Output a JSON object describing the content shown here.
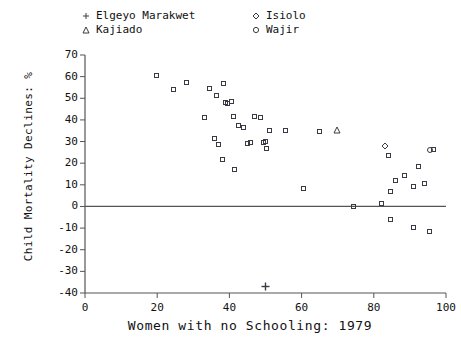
{
  "chart_data": {
    "type": "scatter",
    "title": "",
    "xlabel": "Women with no Schooling: 1979",
    "ylabel": "Child Mortality Declines: %",
    "xlim": [
      0,
      100
    ],
    "ylim": [
      -40,
      70
    ],
    "xticks": [
      0,
      20,
      40,
      60,
      80,
      100
    ],
    "yticks": [
      70,
      60,
      50,
      40,
      30,
      20,
      10,
      0,
      -10,
      -20,
      -30,
      -40
    ],
    "grid": false,
    "zero_reference_line": 0,
    "legend_position": "top",
    "legend": [
      {
        "label": "Elgeyo Marakwet",
        "marker": "plus"
      },
      {
        "label": "Kajiado",
        "marker": "triangle"
      },
      {
        "label": "Isiolo",
        "marker": "diamond"
      },
      {
        "label": "Wajir",
        "marker": "circle"
      }
    ],
    "series": [
      {
        "name": "Districts",
        "marker": "square",
        "points": [
          {
            "x": 19.7,
            "y": 60.5
          },
          {
            "x": 24.5,
            "y": 54.0
          },
          {
            "x": 28.0,
            "y": 57.5
          },
          {
            "x": 34.5,
            "y": 54.5
          },
          {
            "x": 36.5,
            "y": 51.5
          },
          {
            "x": 38.5,
            "y": 57.0
          },
          {
            "x": 39.0,
            "y": 48.0
          },
          {
            "x": 39.5,
            "y": 47.5
          },
          {
            "x": 40.5,
            "y": 48.5
          },
          {
            "x": 33.0,
            "y": 41.0
          },
          {
            "x": 41.0,
            "y": 41.5
          },
          {
            "x": 47.0,
            "y": 41.5
          },
          {
            "x": 48.5,
            "y": 41.0
          },
          {
            "x": 36.0,
            "y": 31.5
          },
          {
            "x": 42.5,
            "y": 37.5
          },
          {
            "x": 44.0,
            "y": 36.5
          },
          {
            "x": 51.0,
            "y": 35.0
          },
          {
            "x": 55.5,
            "y": 35.0
          },
          {
            "x": 65.0,
            "y": 34.5
          },
          {
            "x": 37.0,
            "y": 28.5
          },
          {
            "x": 45.0,
            "y": 29.0
          },
          {
            "x": 45.8,
            "y": 29.5
          },
          {
            "x": 49.5,
            "y": 29.5
          },
          {
            "x": 50.0,
            "y": 30.0
          },
          {
            "x": 50.2,
            "y": 27.0
          },
          {
            "x": 38.0,
            "y": 21.5
          },
          {
            "x": 41.5,
            "y": 17.0
          },
          {
            "x": 60.5,
            "y": 8.5
          },
          {
            "x": 74.5,
            "y": 0.0
          },
          {
            "x": 82.0,
            "y": 1.5
          },
          {
            "x": 84.5,
            "y": 7.0
          },
          {
            "x": 86.0,
            "y": 12.0
          },
          {
            "x": 88.5,
            "y": 14.5
          },
          {
            "x": 84.0,
            "y": 23.5
          },
          {
            "x": 92.5,
            "y": 18.5
          },
          {
            "x": 91.0,
            "y": 9.0
          },
          {
            "x": 94.0,
            "y": 10.5
          },
          {
            "x": 96.5,
            "y": 26.5
          },
          {
            "x": 84.5,
            "y": -6.0
          },
          {
            "x": 91.0,
            "y": -9.5
          },
          {
            "x": 95.5,
            "y": -11.5
          }
        ]
      },
      {
        "name": "Kajiado",
        "marker": "triangle",
        "points": [
          {
            "x": 69.7,
            "y": 38.8
          }
        ]
      },
      {
        "name": "Isiolo",
        "marker": "diamond",
        "points": [
          {
            "x": 83.0,
            "y": 31.0
          }
        ]
      },
      {
        "name": "Wajir",
        "marker": "circle",
        "points": [
          {
            "x": 95.7,
            "y": 26.0
          }
        ]
      },
      {
        "name": "Elgeyo Marakwet",
        "marker": "plus",
        "points": [
          {
            "x": 50.0,
            "y": -34.0
          }
        ]
      }
    ]
  },
  "axes": {
    "x_title": "Women with no Schooling: 1979",
    "y_title": "Child Mortality Declines: %",
    "x_tick_labels": [
      "0",
      "20",
      "40",
      "60",
      "80",
      "100"
    ],
    "y_tick_labels": [
      "70",
      "60",
      "50",
      "40",
      "30",
      "20",
      "10",
      "0",
      "-10",
      "-20",
      "-30",
      "-40"
    ]
  },
  "legend": {
    "entries": [
      {
        "label": "Elgeyo Marakwet"
      },
      {
        "label": "Kajiado"
      },
      {
        "label": "Isiolo"
      },
      {
        "label": "Wajir"
      }
    ]
  },
  "colors": {
    "marker": "#3a3a44",
    "axis": "#555555",
    "text": "#111111",
    "background": "#ffffff"
  }
}
